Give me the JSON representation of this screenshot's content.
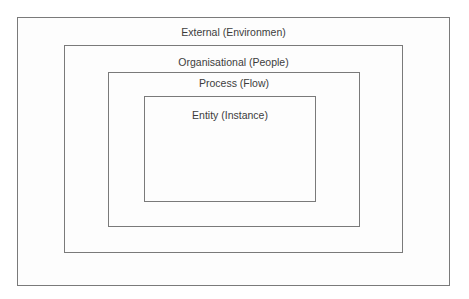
{
  "diagram": {
    "type": "nested-boxes",
    "layers": [
      {
        "label": "External (Environmen)"
      },
      {
        "label": "Organisational (People)"
      },
      {
        "label": "Process (Flow)"
      },
      {
        "label": "Entity (Instance)"
      }
    ],
    "colors": {
      "border": "#7a7a7a",
      "text": "#3c3c3c",
      "background": "#ffffff"
    }
  }
}
